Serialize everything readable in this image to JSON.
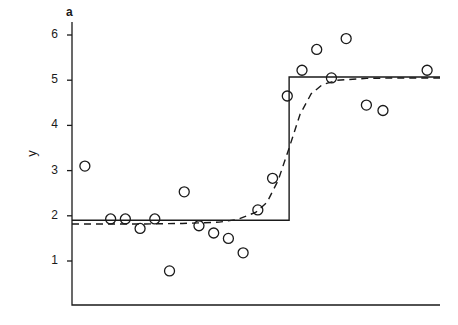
{
  "figure": {
    "panel_tag": "a",
    "ylabel": "y",
    "background": "#ffffff",
    "ink_color": "#1a1a1a"
  },
  "axes": {
    "y_ticks": [
      1,
      2,
      3,
      4,
      5,
      6
    ],
    "y_tick_labels": [
      "1",
      "2",
      "3",
      "4",
      "5",
      "6"
    ],
    "x_ticks": [],
    "x_tick_labels": []
  },
  "chart_data": {
    "type": "scatter",
    "title": "",
    "subtitle": "",
    "panel_label": "a",
    "xlabel": "",
    "ylabel": "y",
    "xlim": [
      0,
      1
    ],
    "ylim": [
      0.32,
      6.4
    ],
    "grid": false,
    "legend": false,
    "legend_position": "none",
    "x_axis_visible": true,
    "x_axis_ticks_shown": false,
    "annotations": [
      "Panel label 'a' above the y-axis",
      "Solid line: fitted step (threshold) regression, jumps from 1.90 to 5.07 at x = 0.59",
      "Dashed line: smooth logistic/sigmoid fit rising from 1.82 to 5.05"
    ],
    "series": [
      {
        "name": "observations",
        "type": "scatter",
        "marker": "open-circle",
        "marker_size": 7,
        "color": "#1a1a1a",
        "x": [
          0.035,
          0.105,
          0.145,
          0.185,
          0.225,
          0.265,
          0.305,
          0.345,
          0.385,
          0.425,
          0.465,
          0.505,
          0.545,
          0.585,
          0.625,
          0.665,
          0.705,
          0.745,
          0.785,
          0.825,
          0.865,
          0.905,
          0.945,
          0.985
        ],
        "y": [
          3.1,
          1.93,
          1.93,
          1.72,
          1.93,
          0.78,
          2.53,
          1.78,
          1.62,
          1.5,
          1.18,
          2.13,
          2.83,
          4.65,
          5.22,
          5.68,
          5.05,
          5.92,
          4.45,
          4.33,
          5.22,
          1.93,
          1.93,
          1.93
        ],
        "points": [
          {
            "x": 0.035,
            "y": 3.1
          },
          {
            "x": 0.105,
            "y": 1.93
          },
          {
            "x": 0.145,
            "y": 1.93
          },
          {
            "x": 0.185,
            "y": 1.72
          },
          {
            "x": 0.225,
            "y": 1.93
          },
          {
            "x": 0.265,
            "y": 0.78
          },
          {
            "x": 0.305,
            "y": 2.53
          },
          {
            "x": 0.345,
            "y": 1.78
          },
          {
            "x": 0.385,
            "y": 1.62
          },
          {
            "x": 0.425,
            "y": 1.5
          },
          {
            "x": 0.465,
            "y": 1.18
          },
          {
            "x": 0.505,
            "y": 2.13
          },
          {
            "x": 0.545,
            "y": 2.83
          },
          {
            "x": 0.585,
            "y": 4.65
          },
          {
            "x": 0.625,
            "y": 5.22
          },
          {
            "x": 0.665,
            "y": 5.68
          },
          {
            "x": 0.705,
            "y": 5.05
          },
          {
            "x": 0.745,
            "y": 5.92
          },
          {
            "x": 0.8,
            "y": 4.45
          },
          {
            "x": 0.845,
            "y": 4.33
          },
          {
            "x": 0.965,
            "y": 5.22
          }
        ]
      },
      {
        "name": "step-fit",
        "type": "line",
        "style": "solid",
        "width": 1.4,
        "color": "#1a1a1a",
        "x": [
          0.0,
          0.59,
          0.59,
          1.0
        ],
        "y": [
          1.9,
          1.9,
          5.07,
          5.07
        ]
      },
      {
        "name": "smooth-fit",
        "type": "line",
        "style": "dashed",
        "width": 1.4,
        "color": "#1a1a1a",
        "dash_pattern": "7,5",
        "x": [
          0.0,
          0.1,
          0.2,
          0.3,
          0.4,
          0.45,
          0.5,
          0.53,
          0.56,
          0.59,
          0.62,
          0.65,
          0.68,
          0.72,
          0.8,
          0.9,
          1.0
        ],
        "y": [
          1.82,
          1.82,
          1.82,
          1.83,
          1.86,
          1.92,
          2.08,
          2.3,
          2.78,
          3.5,
          4.25,
          4.7,
          4.9,
          5.0,
          5.04,
          5.05,
          5.05
        ]
      }
    ]
  }
}
